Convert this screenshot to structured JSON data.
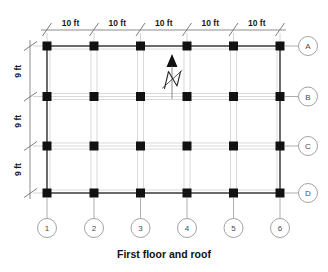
{
  "drawing": {
    "caption": "First floor and roof",
    "north_label": "N",
    "north_arrow_icon": "north-arrow-icon"
  },
  "colors": {
    "column_fill": "#111111",
    "perimeter_beam": "#3a3a3a",
    "interior_beam": "#c9c9c9",
    "dimension_line": "#6e6e6e",
    "bubble_stroke": "#8a8a8a",
    "bubble_text": "#4a4a4a",
    "caption_text": "#111111",
    "background": "#ffffff"
  },
  "top_dimensions": {
    "label_unit": "ft",
    "segments": [
      {
        "label": "10 ft",
        "value": 10
      },
      {
        "label": "10 ft",
        "value": 10
      },
      {
        "label": "10 ft",
        "value": 10
      },
      {
        "label": "10 ft",
        "value": 10
      },
      {
        "label": "10 ft",
        "value": 10
      }
    ],
    "total_label": "50 ft"
  },
  "left_dimensions": {
    "label_unit": "ft",
    "segments": [
      {
        "label": "9 ft",
        "value": 9
      },
      {
        "label": "9 ft",
        "value": 9
      },
      {
        "label": "9 ft",
        "value": 9
      }
    ],
    "total_label": "27 ft"
  },
  "column_grid_lines": [
    {
      "label": "1"
    },
    {
      "label": "2"
    },
    {
      "label": "3"
    },
    {
      "label": "4"
    },
    {
      "label": "5"
    },
    {
      "label": "6"
    }
  ],
  "row_grid_lines": [
    {
      "label": "A"
    },
    {
      "label": "B"
    },
    {
      "label": "C"
    },
    {
      "label": "D"
    }
  ],
  "geometry": {
    "column_x": [
      47,
      94,
      140.5,
      187,
      233.5,
      280
    ],
    "row_y": [
      46,
      96.5,
      146,
      193
    ],
    "column_size": 9,
    "bubble_radius": 9.5,
    "right_bubble_x": 308,
    "bottom_bubble_y": 228,
    "top_dim_line_y": 30,
    "left_dim_line_x": 30
  },
  "chart_data": {
    "type": "table",
    "title": "First floor and roof",
    "bay_widths_ft": [
      10,
      10,
      10,
      10,
      10
    ],
    "bay_depths_ft": [
      9,
      9,
      9
    ],
    "overall_width_ft": 50,
    "overall_depth_ft": 27,
    "column_count": 24,
    "column_lines": [
      "1",
      "2",
      "3",
      "4",
      "5",
      "6"
    ],
    "row_lines": [
      "A",
      "B",
      "C",
      "D"
    ],
    "orientation": "north is up"
  }
}
